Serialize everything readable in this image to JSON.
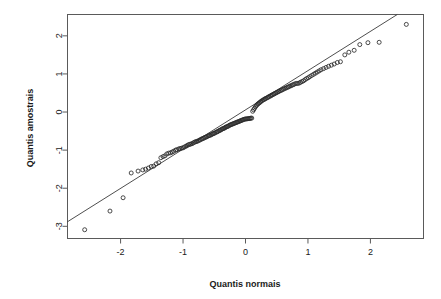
{
  "chart_data": {
    "type": "scatter",
    "title": "",
    "subtitle": "",
    "xlabel": "Quantis normais",
    "ylabel": "Quantis amostrais",
    "xlim": [
      -2.85,
      2.85
    ],
    "ylim": [
      -3.32,
      2.56
    ],
    "grid": false,
    "legend": null,
    "legend_position": "none",
    "xticks": [
      -2,
      -1,
      0,
      1,
      2
    ],
    "xtick_labels": [
      "-2",
      "-1",
      "0",
      "1",
      "2"
    ],
    "yticks": [
      2,
      1,
      0,
      -1,
      -2,
      -3
    ],
    "ytick_labels": [
      "2",
      "1",
      "0",
      "-1",
      "-2",
      "-3"
    ],
    "marker": "open-circle",
    "marker_size": 4,
    "reference_line": {
      "type": "qq-line",
      "slope": 1.03,
      "intercept": 0.05,
      "x_start": -2.85,
      "y_start": -2.88,
      "x_end": 2.42,
      "y_end": 2.55
    },
    "series": [
      {
        "name": "Quantis amostrais vs normais",
        "x": [
          -2.575,
          -2.17,
          -1.96,
          -1.83,
          -1.72,
          -1.645,
          -1.6,
          -1.555,
          -1.51,
          -1.47,
          -1.43,
          -1.39,
          -1.355,
          -1.32,
          -1.29,
          -1.26,
          -1.23,
          -1.2,
          -1.175,
          -1.15,
          -1.12,
          -1.1,
          -1.07,
          -1.05,
          -1.025,
          -1.0,
          -0.98,
          -0.955,
          -0.935,
          -0.915,
          -0.895,
          -0.875,
          -0.855,
          -0.835,
          -0.815,
          -0.795,
          -0.78,
          -0.76,
          -0.74,
          -0.725,
          -0.705,
          -0.69,
          -0.67,
          -0.655,
          -0.635,
          -0.62,
          -0.6,
          -0.585,
          -0.57,
          -0.55,
          -0.535,
          -0.52,
          -0.505,
          -0.49,
          -0.47,
          -0.455,
          -0.44,
          -0.425,
          -0.41,
          -0.395,
          -0.38,
          -0.365,
          -0.35,
          -0.335,
          -0.32,
          -0.305,
          -0.29,
          -0.275,
          -0.26,
          -0.245,
          -0.23,
          -0.215,
          -0.2,
          -0.185,
          -0.17,
          -0.155,
          -0.14,
          -0.125,
          -0.11,
          -0.095,
          -0.08,
          -0.065,
          -0.05,
          -0.035,
          -0.02,
          -0.005,
          0.01,
          0.025,
          0.04,
          0.055,
          0.07,
          0.085,
          0.1,
          0.115,
          0.13,
          0.145,
          0.16,
          0.175,
          0.19,
          0.205,
          0.22,
          0.235,
          0.25,
          0.265,
          0.285,
          0.3,
          0.315,
          0.33,
          0.35,
          0.365,
          0.38,
          0.4,
          0.415,
          0.43,
          0.45,
          0.465,
          0.485,
          0.5,
          0.52,
          0.535,
          0.555,
          0.575,
          0.59,
          0.61,
          0.63,
          0.65,
          0.67,
          0.69,
          0.71,
          0.73,
          0.75,
          0.77,
          0.79,
          0.815,
          0.835,
          0.86,
          0.88,
          0.905,
          0.93,
          0.955,
          0.98,
          1.005,
          1.03,
          1.06,
          1.09,
          1.12,
          1.15,
          1.18,
          1.21,
          1.25,
          1.29,
          1.33,
          1.375,
          1.42,
          1.47,
          1.52,
          1.59,
          1.655,
          1.74,
          1.83,
          1.96,
          2.14,
          2.575
        ],
        "y": [
          -3.09,
          -2.6,
          -2.25,
          -1.6,
          -1.55,
          -1.52,
          -1.5,
          -1.47,
          -1.43,
          -1.42,
          -1.36,
          -1.33,
          -1.2,
          -1.17,
          -1.15,
          -1.1,
          -1.08,
          -1.07,
          -1.05,
          -1.03,
          -1.0,
          -0.99,
          -0.97,
          -0.96,
          -0.95,
          -0.94,
          -0.92,
          -0.9,
          -0.88,
          -0.86,
          -0.85,
          -0.84,
          -0.83,
          -0.81,
          -0.79,
          -0.78,
          -0.77,
          -0.76,
          -0.74,
          -0.73,
          -0.71,
          -0.7,
          -0.69,
          -0.67,
          -0.66,
          -0.65,
          -0.63,
          -0.62,
          -0.61,
          -0.6,
          -0.58,
          -0.57,
          -0.56,
          -0.55,
          -0.53,
          -0.52,
          -0.51,
          -0.49,
          -0.48,
          -0.47,
          -0.45,
          -0.44,
          -0.43,
          -0.42,
          -0.4,
          -0.39,
          -0.38,
          -0.37,
          -0.35,
          -0.34,
          -0.33,
          -0.32,
          -0.31,
          -0.3,
          -0.29,
          -0.28,
          -0.27,
          -0.26,
          -0.25,
          -0.24,
          -0.23,
          -0.22,
          -0.21,
          -0.2,
          -0.19,
          -0.185,
          -0.18,
          -0.18,
          -0.175,
          -0.17,
          -0.17,
          -0.16,
          -0.16,
          0.02,
          0.06,
          0.1,
          0.14,
          0.17,
          0.2,
          0.22,
          0.24,
          0.26,
          0.28,
          0.3,
          0.32,
          0.33,
          0.35,
          0.36,
          0.38,
          0.39,
          0.41,
          0.42,
          0.44,
          0.45,
          0.47,
          0.48,
          0.5,
          0.51,
          0.53,
          0.54,
          0.56,
          0.57,
          0.59,
          0.6,
          0.62,
          0.63,
          0.65,
          0.66,
          0.68,
          0.69,
          0.71,
          0.72,
          0.74,
          0.75,
          0.75,
          0.76,
          0.78,
          0.8,
          0.82,
          0.85,
          0.88,
          0.9,
          0.93,
          0.96,
          0.99,
          1.02,
          1.05,
          1.08,
          1.11,
          1.14,
          1.17,
          1.2,
          1.23,
          1.26,
          1.3,
          1.32,
          1.5,
          1.57,
          1.62,
          1.77,
          1.82,
          1.83,
          2.3
        ]
      }
    ]
  },
  "plot": {
    "background_color": "#ffffff",
    "axis_color": "#5a5a5a",
    "point_color": "#2b2b2b",
    "line_color": "#3a3a3a"
  }
}
